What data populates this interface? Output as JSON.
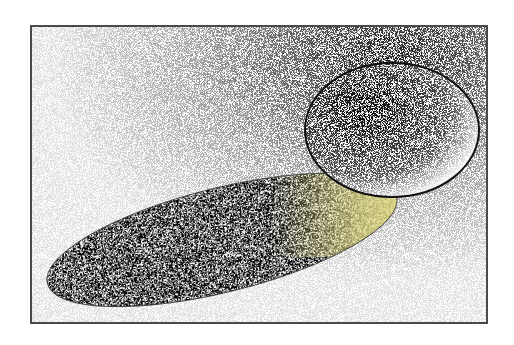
{
  "illustration": {
    "subject": "stippled ball casting elongated shadow",
    "frame": {
      "x": 30,
      "y": 25,
      "width": 458,
      "height": 299,
      "border_color": "#4a4a4a"
    },
    "ball": {
      "cx": 390,
      "cy": 128,
      "rx": 88,
      "ry": 68,
      "outline_color": "#111111"
    },
    "shadow": {
      "cx": 220,
      "cy": 238,
      "rx": 180,
      "ry": 52,
      "rotation_deg": -14,
      "fill_color": "#8a8a8a"
    },
    "reflected_light": {
      "color": "#e6e08a"
    },
    "stipple_color": "#222222"
  }
}
